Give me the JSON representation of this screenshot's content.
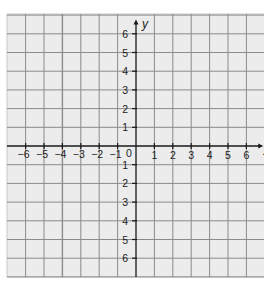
{
  "chart_data": {
    "type": "coordinate-grid",
    "title": "",
    "xlabel": "x",
    "ylabel": "y",
    "xlim": [
      -7,
      7
    ],
    "ylim": [
      -6.5,
      6.5
    ],
    "grid": true,
    "x_tick_labels": [
      "−6",
      "−5",
      "−4",
      "−3",
      "−2",
      "−1",
      "0",
      "1",
      "2",
      "3",
      "4",
      "5",
      "6"
    ],
    "x_ticks": [
      -6,
      -5,
      -4,
      -3,
      -2,
      -1,
      1,
      2,
      3,
      4,
      5,
      6
    ],
    "y_ticks_positive": [
      1,
      2,
      3,
      4,
      5,
      6
    ],
    "y_tick_labels_positive": [
      "1",
      "2",
      "3",
      "4",
      "5",
      "6"
    ],
    "y_ticks_negative": [
      -1,
      -2,
      -3,
      -4,
      -5,
      -6
    ],
    "y_tick_labels_negative": [
      "1",
      "2",
      "3",
      "4",
      "5",
      "6"
    ],
    "origin_label": "0"
  },
  "colors": {
    "background": "#ececec",
    "page": "#ffffff",
    "grid": "#8a8a8a",
    "axis": "#1a1a1a",
    "text": "#222222"
  },
  "layout": {
    "origin_x": 136,
    "origin_y": 146,
    "unit_x": 18.4,
    "unit_y": 18.7,
    "grid_left": 7,
    "grid_top": 14,
    "grid_right": 264,
    "grid_bottom": 277
  }
}
